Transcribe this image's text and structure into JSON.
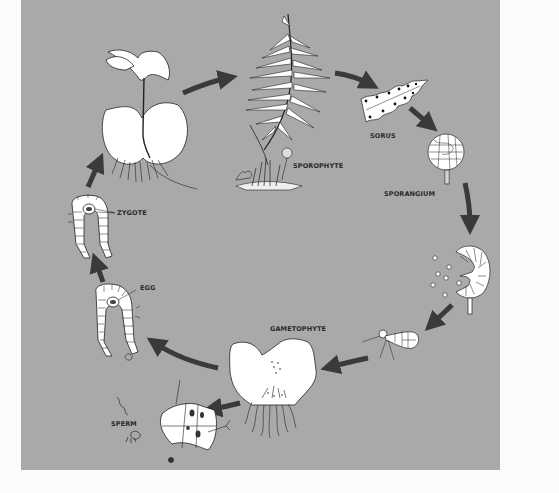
{
  "diagram": {
    "type": "life-cycle",
    "colors": {
      "panel_background": "#a9a9a9",
      "page_background": "#fbfbfb",
      "arrow": "#3a3a3a",
      "drawing_fill": "#ffffff",
      "outline": "#222222",
      "label_text": "#2a2a2a"
    },
    "labels": {
      "sporophyte": "SPOROPHYTE",
      "sorus": "SORUS",
      "sporangium": "SPORANGIUM",
      "gametophyte": "GAMETOPHYTE",
      "zygote": "ZYGOTE",
      "egg": "EGG",
      "sperm": "SPERM"
    },
    "stages": [
      {
        "id": "young-sporophyte",
        "label": ""
      },
      {
        "id": "sporophyte",
        "label": "SPOROPHYTE"
      },
      {
        "id": "sorus",
        "label": "SORUS"
      },
      {
        "id": "sporangium",
        "label": "SPORANGIUM"
      },
      {
        "id": "sporangium-releasing-spores",
        "label": ""
      },
      {
        "id": "germinating-spore",
        "label": ""
      },
      {
        "id": "gametophyte",
        "label": "GAMETOPHYTE"
      },
      {
        "id": "antheridium",
        "label": "SPERM"
      },
      {
        "id": "archegonium",
        "label": "EGG"
      },
      {
        "id": "archegonium-zygote",
        "label": "ZYGOTE"
      }
    ],
    "flow": [
      [
        "young-sporophyte",
        "sporophyte"
      ],
      [
        "sporophyte",
        "sorus"
      ],
      [
        "sorus",
        "sporangium"
      ],
      [
        "sporangium",
        "sporangium-releasing-spores"
      ],
      [
        "sporangium-releasing-spores",
        "germinating-spore"
      ],
      [
        "germinating-spore",
        "gametophyte"
      ],
      [
        "gametophyte",
        "archegonium"
      ],
      [
        "gametophyte",
        "antheridium"
      ],
      [
        "archegonium",
        "archegonium-zygote"
      ],
      [
        "archegonium-zygote",
        "young-sporophyte"
      ]
    ]
  }
}
